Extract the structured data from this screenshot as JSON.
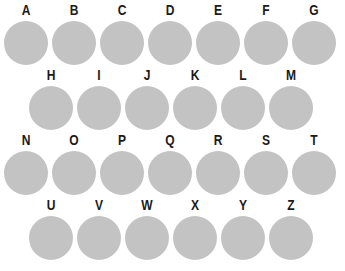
{
  "canvas": {
    "width": 345,
    "height": 271,
    "background_color": "#ffffff"
  },
  "style": {
    "circle_color": "#c3c3c3",
    "label_color": "#1a1a1a",
    "circle_diameter": 44,
    "row_height": 65,
    "column_pitch": 48
  },
  "grid": {
    "shape": "staggered-honeycomb",
    "rows": [
      {
        "index": 0,
        "offset_x": 4,
        "count": 7,
        "cells": [
          {
            "label": "A"
          },
          {
            "label": "B"
          },
          {
            "label": "C"
          },
          {
            "label": "D"
          },
          {
            "label": "E"
          },
          {
            "label": "F"
          },
          {
            "label": "G"
          }
        ]
      },
      {
        "index": 1,
        "offset_x": 29,
        "count": 6,
        "cells": [
          {
            "label": "H"
          },
          {
            "label": "I"
          },
          {
            "label": "J"
          },
          {
            "label": "K"
          },
          {
            "label": "L"
          },
          {
            "label": "M"
          }
        ]
      },
      {
        "index": 2,
        "offset_x": 4,
        "count": 7,
        "cells": [
          {
            "label": "N"
          },
          {
            "label": "O"
          },
          {
            "label": "P"
          },
          {
            "label": "Q"
          },
          {
            "label": "R"
          },
          {
            "label": "S"
          },
          {
            "label": "T"
          }
        ]
      },
      {
        "index": 3,
        "offset_x": 29,
        "count": 6,
        "cells": [
          {
            "label": "U"
          },
          {
            "label": "V"
          },
          {
            "label": "W"
          },
          {
            "label": "X"
          },
          {
            "label": "Y"
          },
          {
            "label": "Z"
          }
        ]
      }
    ]
  }
}
